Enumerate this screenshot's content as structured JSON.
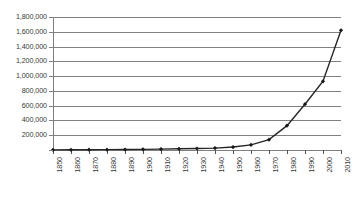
{
  "chart_data": {
    "type": "line",
    "title": "",
    "subtitle": "",
    "xlabel": "",
    "ylabel": "",
    "categories": [
      "1850",
      "1860",
      "1870",
      "1880",
      "1890",
      "1900",
      "1910",
      "1920",
      "1930",
      "1940",
      "1950",
      "1960",
      "1970",
      "1980",
      "1990",
      "2000",
      "2010"
    ],
    "x": [
      1850,
      1860,
      1870,
      1880,
      1890,
      1900,
      1910,
      1920,
      1930,
      1940,
      1950,
      1960,
      1970,
      1980,
      1990,
      2000,
      2010
    ],
    "values": [
      2000,
      3000,
      4000,
      5000,
      7000,
      9000,
      12000,
      16000,
      20000,
      26000,
      40000,
      70000,
      140000,
      330000,
      620000,
      930000,
      1620000
    ],
    "series": [
      {
        "name": "Series 1",
        "values": [
          2000,
          3000,
          4000,
          5000,
          7000,
          9000,
          12000,
          16000,
          20000,
          26000,
          40000,
          70000,
          140000,
          330000,
          620000,
          930000,
          1620000
        ]
      }
    ],
    "ylim": [
      0,
      1800000
    ],
    "xlim": [
      1850,
      2010
    ],
    "ytick_values": [
      0,
      200000,
      400000,
      600000,
      800000,
      1000000,
      1200000,
      1400000,
      1600000,
      1800000
    ],
    "ytick_labels": [
      "",
      "200,000",
      "400,000",
      "600,000",
      "800,000",
      "1,000,000",
      "1,200,000",
      "1,400,000",
      "1,600,000",
      "1,800,000"
    ],
    "xtick_labels": [
      "1850",
      "1860",
      "1870",
      "1880",
      "1890",
      "1900",
      "1910",
      "1920",
      "1930",
      "1940",
      "1950",
      "1960",
      "1970",
      "1980",
      "1990",
      "2000",
      "2010"
    ],
    "grid": true,
    "grid_axis": "y",
    "legend": false,
    "legend_position": "none",
    "marker": "diamond",
    "line_color": "#262626",
    "grid_color": "#808080",
    "axis_color": "#808080",
    "text_color": "#3a3a3a",
    "background_color": "#ffffff",
    "annotations": []
  }
}
